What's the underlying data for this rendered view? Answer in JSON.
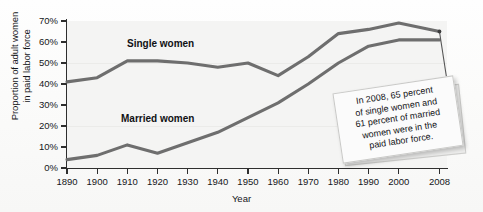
{
  "chart_data": {
    "type": "line",
    "title": "",
    "xlabel": "Year",
    "ylabel": "Proportion of adult women in paid labor force",
    "ylabel_line1": "Proportion of adult women",
    "ylabel_line2": "in paid labor force",
    "x": [
      1890,
      1900,
      1910,
      1920,
      1930,
      1940,
      1950,
      1960,
      1970,
      1980,
      1990,
      2000,
      2008
    ],
    "categories": [
      "1890",
      "1900",
      "1910",
      "1920",
      "1930",
      "1940",
      "1950",
      "1960",
      "1970",
      "1980",
      "1990",
      "2000",
      "2008"
    ],
    "xtick_labels": [
      "1890",
      "1900",
      "1910",
      "1920",
      "1930",
      "1940",
      "1950",
      "1960",
      "1970",
      "1980",
      "1990",
      "2000",
      "2008"
    ],
    "ytick_labels": [
      "0%",
      "10%",
      "20%",
      "30%",
      "40%",
      "50%",
      "60%",
      "70%"
    ],
    "ytick_values": [
      0,
      10,
      20,
      30,
      40,
      50,
      60,
      70
    ],
    "ylim": [
      0,
      70
    ],
    "xlim": [
      1890,
      2008
    ],
    "grid": "faint-horizontal",
    "legend": "inline-labels",
    "series": [
      {
        "name": "Single women",
        "label": "Single women",
        "color": "#6e6e6e",
        "values": [
          41,
          43,
          51,
          51,
          50,
          48,
          50,
          44,
          53,
          64,
          66,
          69,
          65
        ]
      },
      {
        "name": "Married women",
        "label": "Married women",
        "color": "#6e6e6e",
        "values": [
          4,
          6,
          11,
          7,
          12,
          17,
          24,
          31,
          40,
          50,
          58,
          61,
          61
        ]
      }
    ],
    "annotations": [
      {
        "name": "callout-2008",
        "text": "In 2008, 65 percent of single women and 61 percent of married women were in the paid labor force.",
        "lines": [
          "In 2008, 65 percent",
          "of single women and",
          "61 percent of married",
          "women were in the",
          "paid labor force."
        ],
        "points_to_x": 2008,
        "points_to_y": 65
      }
    ]
  }
}
